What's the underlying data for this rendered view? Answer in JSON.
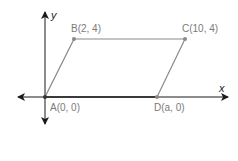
{
  "diagram": {
    "type": "coordinate-geometry",
    "axes": {
      "x_label": "x",
      "y_label": "y"
    },
    "shape": "parallelogram",
    "points": [
      {
        "id": "A",
        "label": "A(0, 0)"
      },
      {
        "id": "B",
        "label": "B(2, 4)"
      },
      {
        "id": "C",
        "label": "C(10, 4)"
      },
      {
        "id": "D",
        "label": "D(a, 0)"
      }
    ],
    "colors": {
      "axis": "#1a1a1a",
      "shape": "#8a8a8a",
      "label": "#7a7a7a",
      "base": "#3a3a3a"
    }
  }
}
